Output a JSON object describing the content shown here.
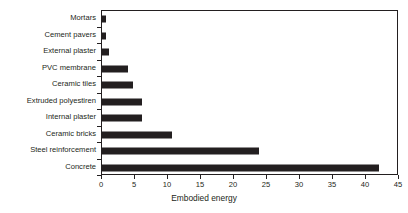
{
  "chart_data": {
    "type": "bar",
    "orientation": "horizontal",
    "title": "",
    "xlabel": "Embodied energy",
    "ylabel": "",
    "xlim": [
      0,
      45
    ],
    "xticks": [
      0,
      5,
      10,
      15,
      20,
      25,
      30,
      35,
      40,
      45
    ],
    "grid": false,
    "legend": null,
    "bar_color": "#231f20",
    "frame_color": "#231f20",
    "background": "#ffffff",
    "categories": [
      "Mortars",
      "Cement pavers",
      "External plaster",
      "PVC membrane",
      "Ceramic tiles",
      "Extruded polyestiren",
      "Internal plaster",
      "Ceramic bricks",
      "Steel reinforcement",
      "Concrete"
    ],
    "values": [
      0.6,
      0.6,
      1.1,
      3.9,
      4.7,
      6.0,
      6.1,
      10.6,
      23.8,
      41.9
    ]
  }
}
